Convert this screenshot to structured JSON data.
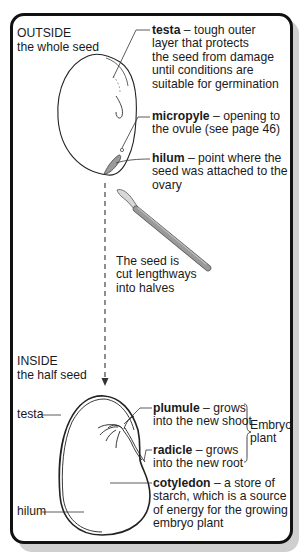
{
  "outside": {
    "heading": "OUTSIDE",
    "subheading": "the whole seed",
    "labels": {
      "testa": {
        "term": "testa",
        "lines": [
          " – tough outer",
          "layer that protects",
          "the seed from damage",
          "until conditions are",
          "suitable for germination"
        ]
      },
      "micropyle": {
        "term": "micropyle",
        "lines": [
          " – opening to",
          "the ovule (see page 46)"
        ]
      },
      "hilum": {
        "term": "hilum",
        "lines": [
          " – point where the",
          "seed was attached to the",
          "ovary"
        ]
      }
    }
  },
  "cut_note": {
    "lines": [
      "The seed is",
      "cut lengthways",
      "into halves"
    ],
    "tool_icon": "scalpel-icon"
  },
  "inside": {
    "heading": "INSIDE",
    "subheading": "the half seed",
    "left_labels": {
      "testa": "testa",
      "hilum": "hilum"
    },
    "labels": {
      "plumule": {
        "term": "plumule",
        "lines": [
          " – grows",
          "into the new shoot"
        ]
      },
      "radicle": {
        "term": "radicle",
        "lines": [
          " – grows",
          "into the new root"
        ]
      },
      "cotyledon": {
        "term": "cotyledon",
        "lines": [
          " – a store of",
          "starch, which is a source",
          "of energy for the growing",
          "embryo plant"
        ]
      }
    },
    "embryo_brace": [
      "Embryo",
      "plant"
    ]
  },
  "colors": {
    "frame": "#111111",
    "shadow": "#cfcfcf",
    "scalpel": "#8c8c8c",
    "hilum_fill": "#9a9a9a"
  }
}
